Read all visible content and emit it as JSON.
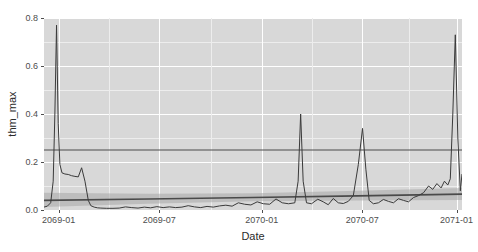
{
  "chart_data": {
    "type": "line",
    "title": "",
    "xlabel": "Date",
    "ylabel": "thm_max",
    "xlim": [
      "2068-12-15",
      "2071-01-10"
    ],
    "ylim": [
      0.0,
      0.8
    ],
    "grid": true,
    "legend": false,
    "y_ticks": [
      "0.0",
      "0.2",
      "0.4",
      "0.6",
      "0.8"
    ],
    "y_tick_values": [
      0.0,
      0.2,
      0.4,
      0.6,
      0.8
    ],
    "x_ticks": [
      "2069-01",
      "2069-07",
      "2070-01",
      "2070-07",
      "2071-01"
    ],
    "x_tick_values": [
      "2069-01-01",
      "2069-07-01",
      "2070-01-01",
      "2070-07-01",
      "2071-01-01"
    ],
    "panel_background": "#d8d8d8",
    "gridline_color": "#ffffff",
    "series": [
      {
        "name": "thm_max observed",
        "role": "data-line",
        "color": "#3a3a3a",
        "x": [
          0.0,
          0.008,
          0.016,
          0.022,
          0.026,
          0.03,
          0.034,
          0.038,
          0.043,
          0.05,
          0.058,
          0.066,
          0.074,
          0.082,
          0.09,
          0.098,
          0.106,
          0.112,
          0.12,
          0.128,
          0.136,
          0.15,
          0.165,
          0.18,
          0.195,
          0.21,
          0.225,
          0.24,
          0.255,
          0.27,
          0.285,
          0.3,
          0.315,
          0.33,
          0.345,
          0.36,
          0.375,
          0.39,
          0.405,
          0.42,
          0.435,
          0.45,
          0.465,
          0.48,
          0.495,
          0.51,
          0.525,
          0.54,
          0.555,
          0.57,
          0.585,
          0.6,
          0.608,
          0.614,
          0.62,
          0.628,
          0.64,
          0.655,
          0.668,
          0.68,
          0.692,
          0.704,
          0.716,
          0.728,
          0.74,
          0.752,
          0.762,
          0.77,
          0.778,
          0.788,
          0.8,
          0.812,
          0.824,
          0.836,
          0.848,
          0.86,
          0.872,
          0.884,
          0.896,
          0.908,
          0.92,
          0.93,
          0.94,
          0.95,
          0.958,
          0.966,
          0.972,
          0.978,
          0.984,
          0.99,
          0.996,
          1.0
        ],
        "y": [
          0.012,
          0.016,
          0.03,
          0.12,
          0.4,
          0.77,
          0.36,
          0.19,
          0.155,
          0.15,
          0.148,
          0.143,
          0.14,
          0.138,
          0.176,
          0.12,
          0.04,
          0.018,
          0.012,
          0.009,
          0.008,
          0.007,
          0.007,
          0.008,
          0.013,
          0.01,
          0.008,
          0.012,
          0.009,
          0.014,
          0.01,
          0.013,
          0.01,
          0.012,
          0.018,
          0.013,
          0.01,
          0.015,
          0.012,
          0.017,
          0.02,
          0.016,
          0.03,
          0.024,
          0.021,
          0.034,
          0.026,
          0.024,
          0.046,
          0.03,
          0.026,
          0.03,
          0.12,
          0.4,
          0.12,
          0.03,
          0.026,
          0.045,
          0.034,
          0.022,
          0.048,
          0.03,
          0.027,
          0.036,
          0.06,
          0.19,
          0.34,
          0.17,
          0.04,
          0.026,
          0.03,
          0.044,
          0.036,
          0.03,
          0.047,
          0.04,
          0.034,
          0.052,
          0.06,
          0.072,
          0.1,
          0.086,
          0.11,
          0.092,
          0.12,
          0.104,
          0.13,
          0.4,
          0.73,
          0.3,
          0.08,
          0.15
        ]
      },
      {
        "name": "trend fit",
        "role": "trend-line",
        "color": "#4a4a4a",
        "x": [
          0.0,
          0.25,
          0.5,
          0.75,
          1.0
        ],
        "y": [
          0.04,
          0.046,
          0.052,
          0.059,
          0.066
        ]
      },
      {
        "name": "confidence ribbon",
        "role": "ribbon",
        "color": "#a8a8a8",
        "opacity": 0.55,
        "x": [
          0.0,
          0.25,
          0.5,
          0.75,
          1.0
        ],
        "ymin": [
          0.012,
          0.026,
          0.036,
          0.04,
          0.042
        ],
        "ymax": [
          0.072,
          0.068,
          0.07,
          0.08,
          0.092
        ]
      }
    ],
    "annotations": [
      {
        "name": "threshold-line",
        "role": "hline",
        "value": 0.25,
        "color": "#4a4a4a",
        "label": ""
      }
    ]
  }
}
